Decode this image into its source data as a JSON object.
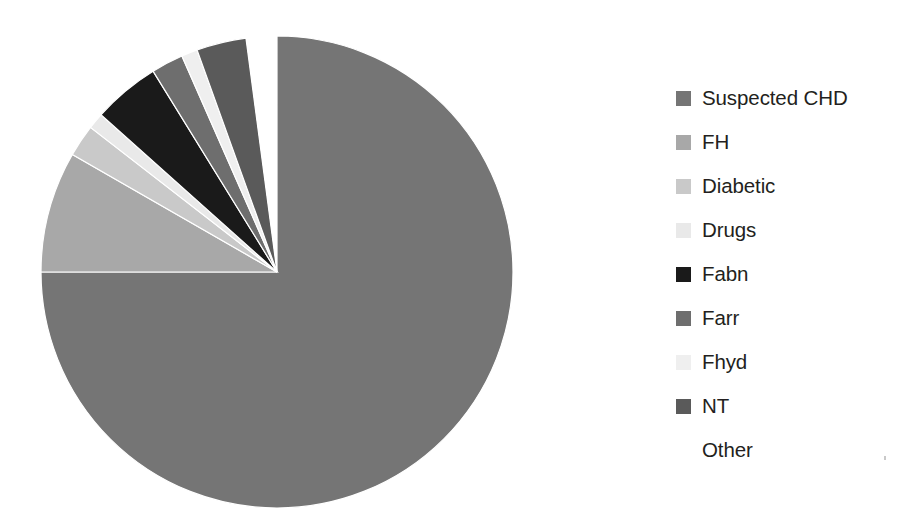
{
  "chart_data": {
    "type": "pie",
    "title": "",
    "subtitle": "",
    "xlabel": "",
    "ylabel": "",
    "legend_position": "right",
    "grid": false,
    "start_angle_deg": 0,
    "direction": "clockwise",
    "categories": [
      "Suspected CHD",
      "FH",
      "Diabetic",
      "Drugs",
      "Fabn",
      "Farr",
      "Fhyd",
      "NT",
      "Other"
    ],
    "values": [
      75.0,
      8.3,
      2.2,
      1.1,
      4.6,
      2.2,
      1.1,
      3.4,
      2.1
    ],
    "units": "percent",
    "slices": [
      {
        "label": "Suspected CHD",
        "value": 75.0,
        "color": "#757575",
        "swatch_color": "#757575"
      },
      {
        "label": "FH",
        "value": 8.3,
        "color": "#a8a8a8",
        "swatch_color": "#a8a8a8"
      },
      {
        "label": "Diabetic",
        "value": 2.2,
        "color": "#c9c9c9",
        "swatch_color": "#c9c9c9"
      },
      {
        "label": "Drugs",
        "value": 1.1,
        "color": "#e9e9e9",
        "swatch_color": "#e9e9e9"
      },
      {
        "label": "Fabn",
        "value": 4.6,
        "color": "#1a1a1a",
        "swatch_color": "#1a1a1a"
      },
      {
        "label": "Farr",
        "value": 2.2,
        "color": "#6e6e6e",
        "swatch_color": "#6e6e6e"
      },
      {
        "label": "Fhyd",
        "value": 1.1,
        "color": "#efefef",
        "swatch_color": "#efefef"
      },
      {
        "label": "NT",
        "value": 3.4,
        "color": "#5a5a5a",
        "swatch_color": "#5a5a5a"
      },
      {
        "label": "Other",
        "value": 2.1,
        "color": "#ffffff",
        "swatch_color": "#ffffff"
      }
    ]
  },
  "legend": {
    "items": [
      {
        "label": "Suspected CHD"
      },
      {
        "label": "FH"
      },
      {
        "label": "Diabetic"
      },
      {
        "label": "Drugs"
      },
      {
        "label": "Fabn"
      },
      {
        "label": "Farr"
      },
      {
        "label": "Fhyd"
      },
      {
        "label": "NT"
      },
      {
        "label": "Other"
      }
    ]
  },
  "geometry": {
    "center_x": 277,
    "center_y": 272,
    "radius": 236
  }
}
